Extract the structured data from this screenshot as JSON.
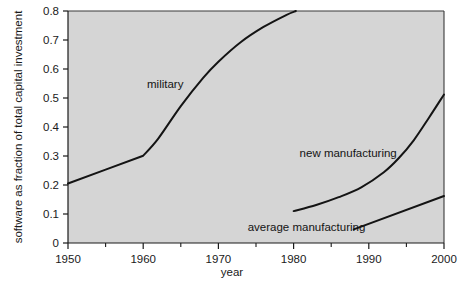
{
  "chart_data": {
    "type": "line",
    "title": "",
    "xlabel": "year",
    "ylabel": "software as fraction of total capital investment",
    "xlim": [
      1950,
      2000
    ],
    "ylim": [
      0,
      0.8
    ],
    "grid": false,
    "legend_position": "inline-annotations",
    "plot_background": "#d5d5d5",
    "line_color": "#141414",
    "xticks": [
      1950,
      1960,
      1970,
      1980,
      1990,
      2000
    ],
    "xtick_labels": [
      "1950",
      "1960",
      "1970",
      "1980",
      "1990",
      "2000"
    ],
    "xminor_ticks": [
      1955,
      1965,
      1975,
      1985,
      1995
    ],
    "yticks": [
      0,
      0.1,
      0.2,
      0.3,
      0.4,
      0.5,
      0.6,
      0.7,
      0.8
    ],
    "ytick_labels": [
      "0",
      "0.1",
      "0.2",
      "0.3",
      "0.4",
      "0.5",
      "0.6",
      "0.7",
      "0.8"
    ],
    "series": [
      {
        "name": "military",
        "label": "military",
        "label_x": 1960.5,
        "label_y": 0.535,
        "x": [
          1950,
          1955,
          1960,
          1962,
          1965,
          1968,
          1970,
          1973,
          1976,
          1979,
          1980.3
        ],
        "y": [
          0.205,
          0.253,
          0.301,
          0.36,
          0.472,
          0.57,
          0.625,
          0.693,
          0.745,
          0.786,
          0.8
        ]
      },
      {
        "name": "new manufacturing",
        "label": "new manufacturing",
        "label_x": 1980.8,
        "label_y": 0.295,
        "x": [
          1980,
          1983,
          1986,
          1989,
          1992,
          1994,
          1996,
          1998,
          2000
        ],
        "y": [
          0.11,
          0.131,
          0.158,
          0.192,
          0.244,
          0.293,
          0.355,
          0.432,
          0.512
        ]
      },
      {
        "name": "average manufacturing",
        "label": "average manufacturing",
        "label_x": 1973.9,
        "label_y": 0.042,
        "x": [
          1988,
          2000
        ],
        "y": [
          0.047,
          0.162
        ]
      }
    ]
  }
}
